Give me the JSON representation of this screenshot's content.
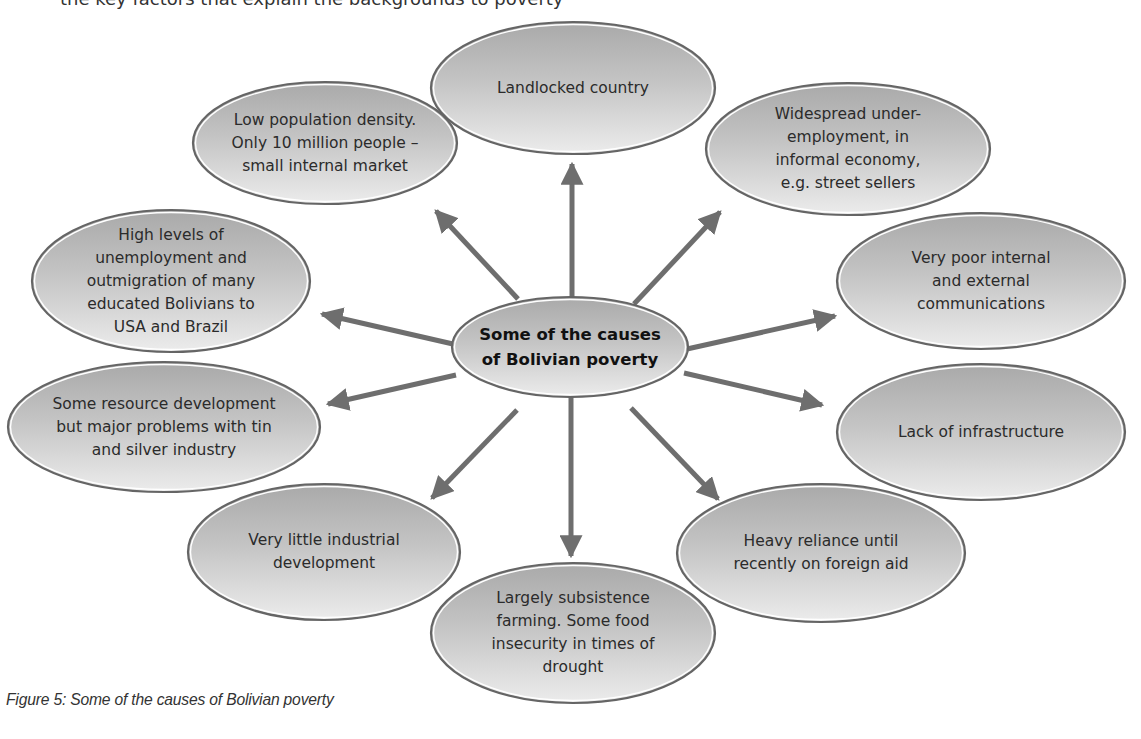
{
  "header": {
    "cut_off_text": "the key factors that explain the backgrounds to poverty"
  },
  "colors": {
    "arrow": "#6e6e6e",
    "ellipse_stroke": "#656565",
    "ellipse_fill_top": "#a9a9a9",
    "ellipse_fill_bottom": "#ececec",
    "text": "#2b2b2b",
    "background": "#ffffff"
  },
  "diagram": {
    "center": {
      "label": "Some of the causes\nof Bolivian poverty",
      "cx": 570,
      "cy": 347,
      "rx": 118,
      "ry": 50
    },
    "causes": [
      {
        "id": "landlocked",
        "label": "Landlocked country",
        "cx": 573,
        "cy": 88,
        "rx": 142,
        "ry": 66
      },
      {
        "id": "low-population",
        "label": "Low population density.\nOnly 10 million people –\nsmall internal market",
        "cx": 325,
        "cy": 143,
        "rx": 132,
        "ry": 61
      },
      {
        "id": "underemployment",
        "label": "Widespread under-\nemployment, in\ninformal economy,\ne.g. street sellers",
        "cx": 848,
        "cy": 149,
        "rx": 142,
        "ry": 66
      },
      {
        "id": "unemployment-outmigration",
        "label": "High levels of\nunemployment and\noutmigration of many\neducated Bolivians to\nUSA and Brazil",
        "cx": 171,
        "cy": 281,
        "rx": 139,
        "ry": 71
      },
      {
        "id": "communications",
        "label": "Very poor internal\nand external\ncommunications",
        "cx": 981,
        "cy": 281,
        "rx": 144,
        "ry": 68
      },
      {
        "id": "resource-development",
        "label": "Some resource development\nbut major problems with tin\nand silver industry",
        "cx": 164,
        "cy": 427,
        "rx": 156,
        "ry": 65
      },
      {
        "id": "infrastructure",
        "label": "Lack of infrastructure",
        "cx": 981,
        "cy": 432,
        "rx": 144,
        "ry": 68
      },
      {
        "id": "industrial-development",
        "label": "Very little industrial\ndevelopment",
        "cx": 324,
        "cy": 552,
        "rx": 136,
        "ry": 68
      },
      {
        "id": "foreign-aid",
        "label": "Heavy reliance until\nrecently on foreign aid",
        "cx": 821,
        "cy": 553,
        "rx": 144,
        "ry": 69
      },
      {
        "id": "subsistence-farming",
        "label": "Largely subsistence\nfarming. Some food\ninsecurity in times of\ndrought",
        "cx": 573,
        "cy": 633,
        "rx": 142,
        "ry": 70
      }
    ],
    "arrows": [
      {
        "target": "landlocked",
        "x1": 572,
        "y1": 297,
        "x2": 572,
        "y2": 164
      },
      {
        "target": "low-population",
        "x1": 518,
        "y1": 299,
        "x2": 436,
        "y2": 211
      },
      {
        "target": "underemployment",
        "x1": 634,
        "y1": 304,
        "x2": 720,
        "y2": 212
      },
      {
        "target": "unemployment-outmigration",
        "x1": 453,
        "y1": 344,
        "x2": 322,
        "y2": 314
      },
      {
        "target": "communications",
        "x1": 687,
        "y1": 349,
        "x2": 835,
        "y2": 316
      },
      {
        "target": "resource-development",
        "x1": 456,
        "y1": 375,
        "x2": 328,
        "y2": 404
      },
      {
        "target": "infrastructure",
        "x1": 684,
        "y1": 373,
        "x2": 822,
        "y2": 405
      },
      {
        "target": "industrial-development",
        "x1": 517,
        "y1": 410,
        "x2": 432,
        "y2": 498
      },
      {
        "target": "subsistence-farming",
        "x1": 571,
        "y1": 397,
        "x2": 571,
        "y2": 556
      },
      {
        "target": "foreign-aid",
        "x1": 631,
        "y1": 408,
        "x2": 718,
        "y2": 499
      }
    ]
  },
  "caption": "Figure 5: Some of the causes of Bolivian poverty"
}
